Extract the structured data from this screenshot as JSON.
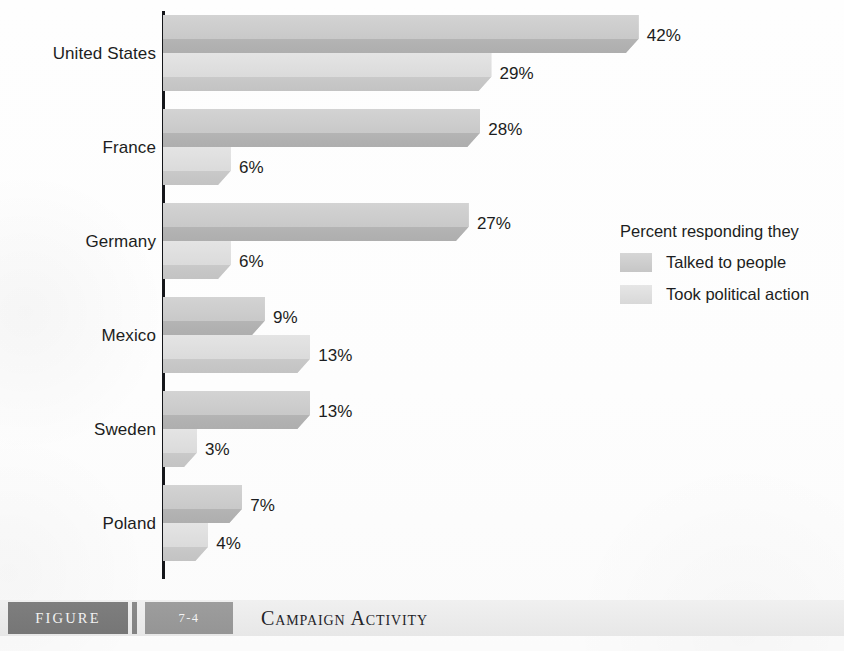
{
  "chart_data": {
    "type": "bar",
    "orientation": "horizontal",
    "title": "Campaign Activity",
    "xlabel": "",
    "ylabel": "",
    "grid": false,
    "xlim": [
      0,
      42
    ],
    "value_suffix": "%",
    "legend_position": "right",
    "categories": [
      "United States",
      "France",
      "Germany",
      "Mexico",
      "Sweden",
      "Poland"
    ],
    "series": [
      {
        "name": "Talked to people",
        "color": "#c8c8c8",
        "values": [
          42,
          28,
          27,
          9,
          13,
          7
        ],
        "labels": [
          "42%",
          "28%",
          "27%",
          "9%",
          "13%",
          "7%"
        ]
      },
      {
        "name": "Took political action",
        "color": "#dcdcdc",
        "values": [
          29,
          6,
          6,
          13,
          3,
          4
        ],
        "labels": [
          "29%",
          "6%",
          "6%",
          "13%",
          "3%",
          "4%"
        ]
      }
    ]
  },
  "legend": {
    "title": "Percent responding they",
    "items": [
      {
        "label": "Talked to people",
        "swatch_color": "#c8c8c8"
      },
      {
        "label": "Took political action",
        "swatch_color": "#dcdcdc"
      }
    ]
  },
  "caption": {
    "figure_word": "FIGURE",
    "figure_number": "7-4",
    "title": "Campaign Activity",
    "box_color": "#787878",
    "number_box_color": "#999999",
    "bar_background": "#ebebeb"
  }
}
